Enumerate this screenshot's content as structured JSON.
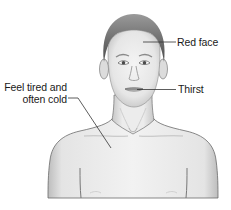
{
  "diagram": {
    "labels": [
      {
        "id": "red-face",
        "text": "Red face",
        "target": "forehead"
      },
      {
        "id": "thirst",
        "text": "Thirst",
        "target": "mouth"
      },
      {
        "id": "tired-cold",
        "lines": [
          "Feel tired and",
          "often cold"
        ],
        "target": "chest"
      }
    ]
  },
  "colors": {
    "background": "#ffffff",
    "skin": "#ececec",
    "skin_shadow": "#c8c8c8",
    "hair": "#6e6e6e",
    "outline": "#555555",
    "leader_line": "#333333",
    "text": "#1a1a1a"
  }
}
